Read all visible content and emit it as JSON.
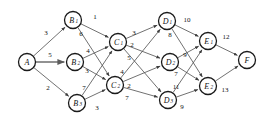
{
  "diagram": {
    "type": "directed-weighted-network",
    "title": "",
    "background_color": "#ffffff",
    "edge_color": "#4c4c4c",
    "node_stroke_color": "#1a1a1a",
    "node_fill_color": "#ffffff",
    "label_color": "#111111"
  },
  "nodes": [
    {
      "id": "A",
      "label": "A",
      "sub": "",
      "x": 27,
      "y": 62
    },
    {
      "id": "B1",
      "label": "B",
      "sub": "1",
      "x": 73,
      "y": 20
    },
    {
      "id": "B2",
      "label": "B",
      "sub": "2",
      "x": 75,
      "y": 62
    },
    {
      "id": "B3",
      "label": "B",
      "sub": "3",
      "x": 77,
      "y": 103
    },
    {
      "id": "C1",
      "label": "C",
      "sub": "1",
      "x": 118,
      "y": 42
    },
    {
      "id": "C2",
      "label": "C",
      "sub": "2",
      "x": 115,
      "y": 85
    },
    {
      "id": "D1",
      "label": "D",
      "sub": "1",
      "x": 167,
      "y": 21
    },
    {
      "id": "D2",
      "label": "D",
      "sub": "2",
      "x": 170,
      "y": 62
    },
    {
      "id": "D3",
      "label": "D",
      "sub": "3",
      "x": 168,
      "y": 100
    },
    {
      "id": "E1",
      "label": "E",
      "sub": "1",
      "x": 208,
      "y": 41
    },
    {
      "id": "E2",
      "label": "E",
      "sub": "2",
      "x": 208,
      "y": 86
    },
    {
      "id": "F",
      "label": "F",
      "sub": "",
      "x": 247,
      "y": 60
    }
  ],
  "node_radius": 8.5,
  "edges": [
    {
      "from": "A",
      "to": "B1",
      "weight": "3",
      "lx": 46,
      "ly": 33
    },
    {
      "from": "A",
      "to": "B2",
      "weight": "5",
      "lx": 50,
      "ly": 55,
      "thick": true
    },
    {
      "from": "A",
      "to": "B3",
      "weight": "2",
      "lx": 48,
      "ly": 88
    },
    {
      "from": "B1",
      "to": "C1",
      "weight": "1",
      "lx": 95,
      "ly": 17
    },
    {
      "from": "B1",
      "to": "C2",
      "weight": "6",
      "lx": 81,
      "ly": 34
    },
    {
      "from": "B2",
      "to": "C1",
      "weight": "4",
      "lx": 88,
      "ly": 51
    },
    {
      "from": "B2",
      "to": "C2",
      "weight": "3",
      "lx": 87,
      "ly": 71
    },
    {
      "from": "B3",
      "to": "C1",
      "weight": "7",
      "lx": 84,
      "ly": 88
    },
    {
      "from": "B3",
      "to": "C2",
      "weight": "3",
      "lx": 97,
      "ly": 108
    },
    {
      "from": "C1",
      "to": "D1",
      "weight": "3",
      "lx": 134,
      "ly": 33
    },
    {
      "from": "C1",
      "to": "D2",
      "weight": "2",
      "lx": 132,
      "ly": 45
    },
    {
      "from": "C1",
      "to": "D3",
      "weight": "5",
      "lx": 129,
      "ly": 58
    },
    {
      "from": "C2",
      "to": "D1",
      "weight": "4",
      "lx": 122,
      "ly": 72
    },
    {
      "from": "C2",
      "to": "D2",
      "weight": "2",
      "lx": 129,
      "ly": 86
    },
    {
      "from": "C2",
      "to": "D3",
      "weight": "7",
      "lx": 127,
      "ly": 98
    },
    {
      "from": "D1",
      "to": "E1",
      "weight": "10",
      "lx": 187,
      "ly": 20
    },
    {
      "from": "D1",
      "to": "E2",
      "weight": "8",
      "lx": 170,
      "ly": 35
    },
    {
      "from": "D2",
      "to": "E1",
      "weight": "9",
      "lx": 185,
      "ly": 55
    },
    {
      "from": "D2",
      "to": "E2",
      "weight": "7",
      "lx": 176,
      "ly": 74
    },
    {
      "from": "D3",
      "to": "E1",
      "weight": "11",
      "lx": 176,
      "ly": 87
    },
    {
      "from": "D3",
      "to": "E2",
      "weight": "9",
      "lx": 182,
      "ly": 107
    },
    {
      "from": "E1",
      "to": "F",
      "weight": "12",
      "lx": 226,
      "ly": 37
    },
    {
      "from": "E2",
      "to": "F",
      "weight": "13",
      "lx": 225,
      "ly": 90
    }
  ]
}
